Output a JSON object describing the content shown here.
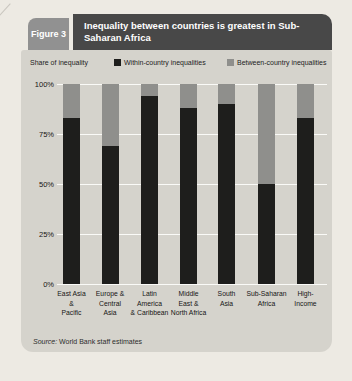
{
  "figure_label": "Figure 3",
  "title": "Inequality between countries is greatest in Sub-Saharan Africa",
  "axis_note": "Share of inequality",
  "legend": [
    {
      "label": "Within-country inequalities",
      "color": "#1e1e1c"
    },
    {
      "label": "Between-country inequalities",
      "color": "#8f8f8c"
    }
  ],
  "source": {
    "prefix": "Source:",
    "text": "World Bank staff estimates"
  },
  "chart_data": {
    "type": "bar",
    "stacked": true,
    "title": "Inequality between countries is greatest in Sub-Saharan Africa",
    "ylabel": "Share of inequality",
    "categories": [
      "East Asia & Pacific",
      "Europe & Central Asia",
      "Latin America & Caribbean",
      "Middle East & North Africa",
      "South Asia",
      "Sub-Saharan Africa",
      "High-Income"
    ],
    "category_lines": [
      [
        "East Asia",
        "&",
        "Pacific"
      ],
      [
        "Europe &",
        "Central",
        "Asia"
      ],
      [
        "Latin",
        "America",
        "& Caribbean"
      ],
      [
        "Middle",
        "East &",
        "North Africa"
      ],
      [
        "South",
        "Asia"
      ],
      [
        "Sub-Saharan",
        "Africa"
      ],
      [
        "High-",
        "Income"
      ]
    ],
    "series": [
      {
        "name": "Within-country inequalities",
        "color": "#1e1e1c",
        "values": [
          83,
          69,
          94,
          88,
          90,
          50,
          83
        ]
      },
      {
        "name": "Between-country inequalities",
        "color": "#8f8f8c",
        "values": [
          17,
          31,
          6,
          12,
          10,
          50,
          17
        ]
      }
    ],
    "ylim": [
      0,
      100
    ],
    "ytick_values": [
      100,
      75,
      50,
      25,
      0
    ],
    "yticks": [
      "100%",
      "75%",
      "50%",
      "25%",
      "0%"
    ],
    "grid": true,
    "legend_position": "top"
  }
}
